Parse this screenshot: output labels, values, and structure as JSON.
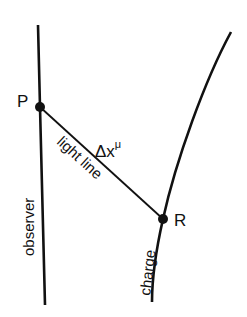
{
  "diagram": {
    "title": "",
    "points": [
      {
        "id": "P",
        "label": "P"
      },
      {
        "id": "R",
        "label": "R"
      }
    ],
    "labels": {
      "observer": "observer",
      "charge": "charge",
      "light_line": "light line",
      "interval_base": "Δx",
      "interval_sup": "μ"
    },
    "colors": {
      "stroke": "#111111",
      "background": "#ffffff"
    }
  }
}
